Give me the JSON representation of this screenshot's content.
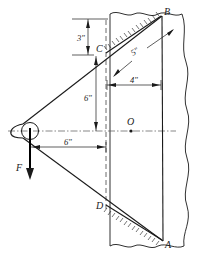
{
  "figure": {
    "points": [
      {
        "id": "B",
        "label": "B",
        "x": 162,
        "y": 16
      },
      {
        "id": "C",
        "label": "C",
        "x": 93,
        "y": 55
      },
      {
        "id": "O",
        "label": "O",
        "x": 131,
        "y": 131
      },
      {
        "id": "D",
        "label": "D",
        "x": 102,
        "y": 204
      },
      {
        "id": "A",
        "label": "A",
        "x": 163,
        "y": 241
      }
    ],
    "dimensions": [
      {
        "id": "dim-3in",
        "label": "3\"",
        "x": 80,
        "y": 40,
        "orientation": "vertical"
      },
      {
        "id": "dim-5in",
        "label": "5\"",
        "x": 137,
        "y": 53,
        "orientation": "inclined"
      },
      {
        "id": "dim-4in",
        "label": "4\"",
        "x": 135,
        "y": 85,
        "orientation": "horizontal"
      },
      {
        "id": "dim-6in-vertical",
        "label": "6\"",
        "x": 84,
        "y": 105,
        "orientation": "vertical"
      },
      {
        "id": "dim-6in-horizontal",
        "label": "6\"",
        "x": 70,
        "y": 147,
        "orientation": "horizontal"
      }
    ],
    "force": {
      "id": "force-F",
      "label": "F",
      "x": 30,
      "y": 166,
      "direction": "down"
    },
    "colors": {
      "line": "#1a1a1a",
      "centerline": "#555555",
      "dashed": "#444444",
      "background": "#ffffff"
    }
  }
}
